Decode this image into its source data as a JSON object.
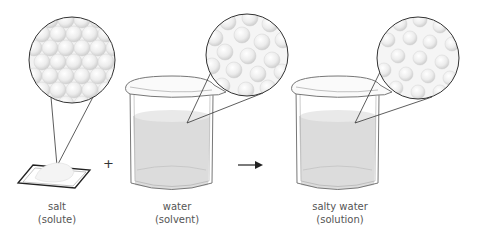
{
  "diagram": {
    "components": [
      {
        "id": "salt",
        "name": "salt",
        "role": "(solute)"
      },
      {
        "id": "water",
        "name": "water",
        "role": "(solvent)"
      },
      {
        "id": "salty_water",
        "name": "salty water",
        "role": "(solution)"
      }
    ],
    "operators": {
      "plus": "+",
      "arrow": "→"
    },
    "colors": {
      "outline": "#333333",
      "liquid": "#dcdcdc",
      "sphere": "#eeeeee",
      "background": "#ffffff",
      "label_text": "#555555"
    }
  }
}
